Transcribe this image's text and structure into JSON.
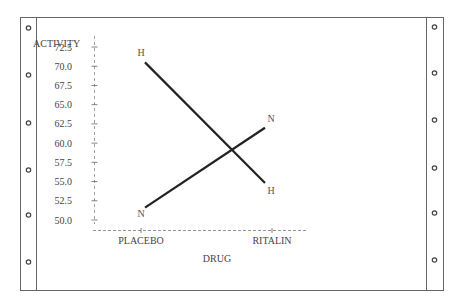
{
  "chart_data": {
    "type": "line",
    "title": "",
    "xlabel": "DRUG",
    "ylabel": "ACTIVITY",
    "categories": [
      "PLACEBO",
      "RITALIN"
    ],
    "series": [
      {
        "name": "H",
        "values": [
          70.5,
          54.8
        ]
      },
      {
        "name": "N",
        "values": [
          51.6,
          62.0
        ]
      }
    ],
    "yticks": [
      "72.5",
      "70.0",
      "67.5",
      "65.0",
      "62.5",
      "60.0",
      "57.5",
      "55.0",
      "52.5",
      "50.0"
    ],
    "ylim": [
      50.0,
      72.5
    ],
    "grid": false,
    "legend": "none (series marked by point labels H and N)"
  },
  "page": {
    "style": "line-printer output on tractor-feed paper",
    "hole_count_per_side": 6
  }
}
